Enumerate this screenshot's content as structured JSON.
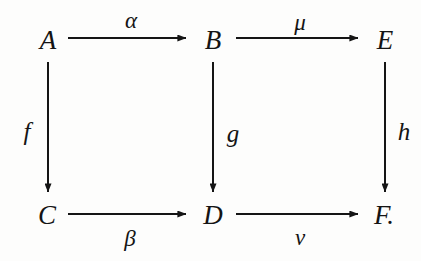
{
  "diagram": {
    "type": "commutative-diagram",
    "background_color": "#fdfdfc",
    "ink_color": "#141414",
    "nodes": [
      {
        "id": "A",
        "label": "A",
        "x": 48,
        "y": 40
      },
      {
        "id": "B",
        "label": "B",
        "x": 213,
        "y": 40
      },
      {
        "id": "E",
        "label": "E",
        "x": 385,
        "y": 40
      },
      {
        "id": "C",
        "label": "C",
        "x": 47,
        "y": 215
      },
      {
        "id": "D",
        "label": "D",
        "x": 213,
        "y": 215
      },
      {
        "id": "F",
        "label": "F.",
        "x": 384,
        "y": 215
      }
    ],
    "edges": [
      {
        "id": "alpha",
        "from": "A",
        "to": "B",
        "label": "α",
        "label_x": 131,
        "label_y": 20,
        "direction": "right",
        "label_position": "above"
      },
      {
        "id": "mu",
        "from": "B",
        "to": "E",
        "label": "μ",
        "label_x": 300,
        "label_y": 22,
        "direction": "right",
        "label_position": "above"
      },
      {
        "id": "beta",
        "from": "C",
        "to": "D",
        "label": "β",
        "label_x": 130,
        "label_y": 238,
        "direction": "right",
        "label_position": "below"
      },
      {
        "id": "nu",
        "from": "D",
        "to": "F",
        "label": "ν",
        "label_x": 300,
        "label_y": 237,
        "direction": "right",
        "label_position": "below"
      },
      {
        "id": "f",
        "from": "A",
        "to": "C",
        "label": "f",
        "label_x": 27,
        "label_y": 131,
        "direction": "down",
        "label_position": "left"
      },
      {
        "id": "g",
        "from": "B",
        "to": "D",
        "label": "g",
        "label_x": 233,
        "label_y": 133,
        "direction": "down",
        "label_position": "right"
      },
      {
        "id": "h",
        "from": "E",
        "to": "F",
        "label": "h",
        "label_x": 404,
        "label_y": 131,
        "direction": "down",
        "label_position": "right"
      }
    ]
  }
}
